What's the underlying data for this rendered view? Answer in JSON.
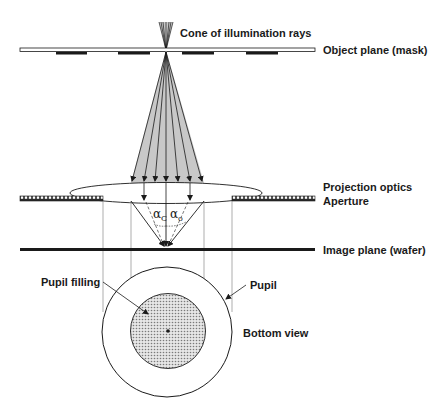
{
  "diagram": {
    "labels": {
      "cone": "Cone of illumination rays",
      "object_plane": "Object plane (mask)",
      "projection_optics": "Projection optics",
      "aperture": "Aperture",
      "image_plane": "Image plane (wafer)",
      "pupil_filling": "Pupil filling",
      "pupil": "Pupil",
      "bottom_view": "Bottom view"
    },
    "angles": {
      "alpha_c_symbol": "α",
      "alpha_c_sub": "C",
      "alpha_o_symbol": "α",
      "alpha_o_sub": "o"
    },
    "colors": {
      "ink": "#1a1a1a",
      "cone_fill": "#c8c8c8",
      "stipple": "#9a9a9a",
      "guide": "#8a8a8a"
    }
  }
}
